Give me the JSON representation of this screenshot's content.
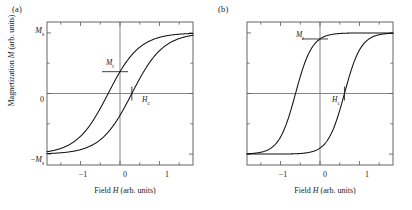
{
  "figure": {
    "panels": [
      {
        "id": "a",
        "label": "(a)",
        "annotations": {
          "remanence": "M",
          "remanence_sub": "r",
          "coercivity": "H",
          "coercivity_sub": "c"
        },
        "xlabel_main": "Field ",
        "xlabel_var": "H",
        "xlabel_units": " (arb. units)"
      },
      {
        "id": "b",
        "label": "(b)",
        "annotations": {
          "remanence": "M",
          "remanence_sub": "r",
          "coercivity": "H",
          "coercivity_sub": "c"
        },
        "xlabel_main": "Field ",
        "xlabel_var": "H",
        "xlabel_units": " (arb. units)"
      }
    ],
    "ylabel_main": "Magnetization ",
    "ylabel_var": "M",
    "ylabel_units": " (arb. units)",
    "ytick_labels": [
      {
        "text": "M",
        "sub": "s",
        "prefix": ""
      },
      {
        "text": "0",
        "sub": "",
        "prefix": ""
      },
      {
        "text": "M",
        "sub": "s",
        "prefix": "−"
      }
    ],
    "xtick_labels": [
      "−1",
      "0",
      "1"
    ],
    "colors": {
      "curve": "#111111",
      "frame": "#555555",
      "axis_line": "#777777",
      "tick": "#555555",
      "text": "#1a1a1a",
      "background": "#ffffff"
    }
  },
  "chart_data": [
    {
      "type": "line",
      "title": "(a)",
      "xlabel": "Field H (arb. units)",
      "ylabel": "Magnetization M (arb. units)",
      "xlim": [
        -1.85,
        1.85
      ],
      "ylim": [
        -1.18,
        1.18
      ],
      "xticks": [
        -1,
        0,
        1
      ],
      "yticks": [
        -1,
        0,
        1
      ],
      "ytick_labels": [
        "-Ms",
        "0",
        "Ms"
      ],
      "grid": false,
      "legend": false,
      "annotations": [
        {
          "label": "Mr",
          "x": 0,
          "y": 0.36
        },
        {
          "label": "Hc",
          "x": 0.3,
          "y": 0
        }
      ],
      "parameters": {
        "saturation": 1.0,
        "remanence": 0.36,
        "coercivity": 0.3,
        "squareness": 0.36,
        "loop_shape": "sheared-narrow"
      },
      "series": [
        {
          "name": "descending-branch",
          "x": [
            -1.85,
            -1.6,
            -1.4,
            -1.2,
            -1.0,
            -0.8,
            -0.6,
            -0.45,
            -0.3,
            -0.15,
            0,
            0.15,
            0.3,
            0.5,
            0.7,
            0.9,
            1.1,
            1.3,
            1.5,
            1.85
          ],
          "y": [
            -1.0,
            -0.99,
            -0.975,
            -0.95,
            -0.9,
            -0.82,
            -0.7,
            -0.57,
            -0.42,
            -0.22,
            0.0,
            0.22,
            0.42,
            0.64,
            0.79,
            0.88,
            0.94,
            0.97,
            0.99,
            1.0
          ]
        },
        {
          "name": "ascending-branch",
          "x": [
            -1.85,
            -1.5,
            -1.3,
            -1.1,
            -0.9,
            -0.7,
            -0.5,
            -0.3,
            -0.15,
            0,
            0.15,
            0.3,
            0.45,
            0.6,
            0.8,
            1.0,
            1.2,
            1.4,
            1.6,
            1.85
          ],
          "y": [
            -1.0,
            -0.99,
            -0.97,
            -0.94,
            -0.88,
            -0.79,
            -0.64,
            -0.42,
            -0.22,
            0.36,
            0.22,
            0.42,
            0.57,
            0.7,
            0.82,
            0.9,
            0.95,
            0.975,
            0.99,
            1.0
          ]
        }
      ]
    },
    {
      "type": "line",
      "title": "(b)",
      "xlabel": "Field H (arb. units)",
      "ylabel": "Magnetization M (arb. units)",
      "xlim": [
        -1.85,
        1.85
      ],
      "ylim": [
        -1.18,
        1.18
      ],
      "xticks": [
        -1,
        0,
        1
      ],
      "yticks": [
        -1,
        0,
        1
      ],
      "ytick_labels": [
        "-Ms",
        "0",
        "Ms"
      ],
      "grid": false,
      "legend": false,
      "annotations": [
        {
          "label": "Mr",
          "x": 0,
          "y": 0.9
        },
        {
          "label": "Hc",
          "x": 0.62,
          "y": 0
        }
      ],
      "parameters": {
        "saturation": 1.0,
        "remanence": 0.9,
        "coercivity": 0.62,
        "squareness": 0.9,
        "loop_shape": "square-wide"
      },
      "series": [
        {
          "name": "descending-branch",
          "x": [
            -1.85,
            -1.6,
            -1.45,
            -1.3,
            -1.15,
            -1.0,
            -0.85,
            -0.7,
            -0.6,
            -0.5,
            -0.35,
            -0.2,
            0,
            0.2,
            0.45,
            0.7,
            1.0,
            1.3,
            1.6,
            1.85
          ],
          "y": [
            -1.0,
            -0.995,
            -0.985,
            -0.96,
            -0.9,
            -0.78,
            -0.55,
            -0.22,
            0.0,
            0.2,
            0.48,
            0.7,
            0.9,
            0.96,
            0.985,
            0.995,
            1.0,
            1.0,
            1.0,
            1.0
          ]
        },
        {
          "name": "ascending-branch",
          "x": [
            -1.85,
            -1.6,
            -1.3,
            -1.0,
            -0.7,
            -0.45,
            -0.2,
            0,
            0.2,
            0.35,
            0.5,
            0.62,
            0.75,
            0.9,
            1.05,
            1.2,
            1.4,
            1.6,
            1.75,
            1.85
          ],
          "y": [
            -1.0,
            -1.0,
            -1.0,
            -0.995,
            -0.985,
            -0.96,
            -0.9,
            -0.9,
            -0.7,
            -0.48,
            -0.2,
            0.0,
            0.22,
            0.55,
            0.78,
            0.9,
            0.96,
            0.985,
            0.995,
            1.0
          ]
        }
      ]
    }
  ]
}
